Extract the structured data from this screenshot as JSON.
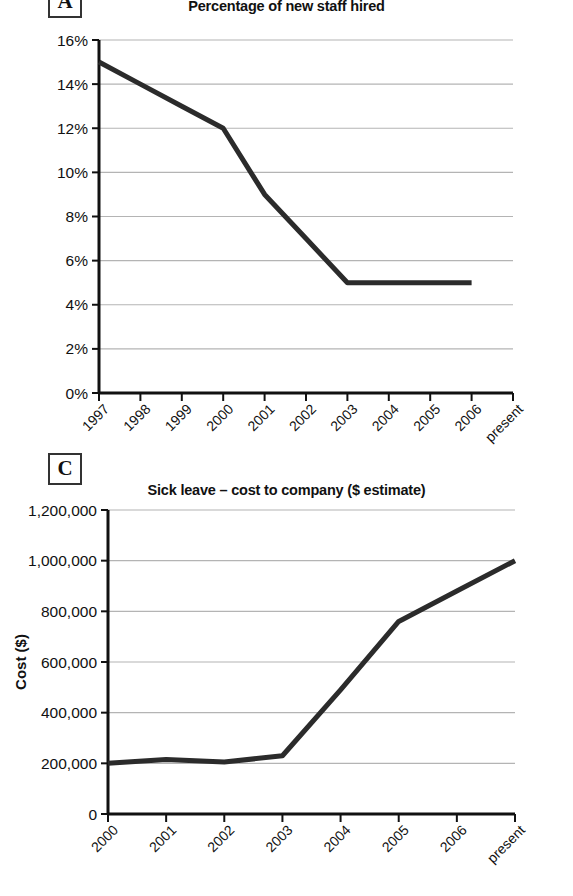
{
  "page": {
    "background_color": "#ffffff",
    "line_color": "#2b2b2b",
    "grid_color": "#b4b4b4",
    "axis_color": "#111111"
  },
  "panels": [
    {
      "badge": "A",
      "title": "Percentage of new staff hired"
    },
    {
      "badge": "C",
      "title": "Sick leave – cost to company ($ estimate)"
    }
  ],
  "chart_data": [
    {
      "type": "line",
      "panel_label": "A",
      "title": "Percentage of new staff hired",
      "xlabel": "",
      "ylabel": "",
      "categories": [
        "1997",
        "1998",
        "1999",
        "2000",
        "2001",
        "2002",
        "2003",
        "2004",
        "2005",
        "2006",
        "present"
      ],
      "x_tick_labels": [
        "1997",
        "1998",
        "1999",
        "2000",
        "2001",
        "2002",
        "2003",
        "2004",
        "2005",
        "2006",
        "present"
      ],
      "y_tick_labels": [
        "0%",
        "2%",
        "4%",
        "6%",
        "8%",
        "10%",
        "12%",
        "14%",
        "16%"
      ],
      "y_tick_values": [
        0,
        2,
        4,
        6,
        8,
        10,
        12,
        14,
        16
      ],
      "values": [
        15,
        14,
        13,
        12,
        9,
        7,
        5,
        5,
        5,
        5,
        null
      ],
      "ylim": [
        0,
        16
      ],
      "grid": true,
      "grid_axis": "y",
      "legend": false,
      "series": [
        {
          "name": "Percentage of new staff hired",
          "values": [
            15,
            14,
            13,
            12,
            9,
            7,
            5,
            5,
            5,
            5,
            null
          ]
        }
      ]
    },
    {
      "type": "line",
      "panel_label": "C",
      "title": "Sick leave – cost to company ($ estimate)",
      "xlabel": "",
      "ylabel": "Cost ($)",
      "categories": [
        "2000",
        "2001",
        "2002",
        "2003",
        "2004",
        "2005",
        "2006",
        "present"
      ],
      "x_tick_labels": [
        "2000",
        "2001",
        "2002",
        "2003",
        "2004",
        "2005",
        "2006",
        "present"
      ],
      "y_tick_labels": [
        "0",
        "200,000",
        "400,000",
        "600,000",
        "800,000",
        "1,000,000",
        "1,200,000"
      ],
      "y_tick_values": [
        0,
        200000,
        400000,
        600000,
        800000,
        1000000,
        1200000
      ],
      "values": [
        200000,
        215000,
        205000,
        230000,
        490000,
        760000,
        880000,
        1000000
      ],
      "ylim": [
        0,
        1200000
      ],
      "grid": true,
      "grid_axis": "y",
      "legend": false,
      "series": [
        {
          "name": "Sick leave cost to company",
          "values": [
            200000,
            215000,
            205000,
            230000,
            490000,
            760000,
            880000,
            1000000
          ]
        }
      ]
    }
  ]
}
